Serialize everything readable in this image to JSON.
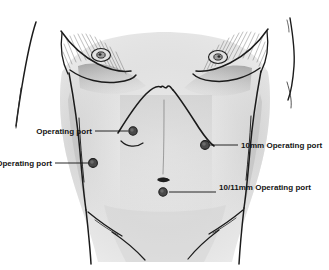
{
  "figure": {
    "background_color": "#ffffff",
    "ink_color": "#1b1b1b",
    "label_color": "#141414",
    "port_fill_color": "#4a4a4a",
    "port_rim_color": "#1c1c1c",
    "width": 329,
    "height": 270
  },
  "ports": [
    {
      "id": "port-upper-left",
      "label": "Operating port",
      "label_side": "left",
      "label_x": 92,
      "label_y": 134,
      "leader_from_x": 95,
      "leader_from_y": 131,
      "leader_to_x": 128,
      "leader_to_y": 131,
      "dot_x": 133,
      "dot_y": 131,
      "dot_r": 4.2
    },
    {
      "id": "port-lower-left",
      "label": "Operating port",
      "label_side": "left",
      "label_x": 52,
      "label_y": 166,
      "leader_from_x": 55,
      "leader_from_y": 163,
      "leader_to_x": 88,
      "leader_to_y": 163,
      "dot_x": 93,
      "dot_y": 163,
      "dot_r": 4.4
    },
    {
      "id": "port-10mm-right",
      "label": "10mm Operating port",
      "label_side": "right",
      "label_x": 241,
      "label_y": 148,
      "leader_from_x": 210,
      "leader_from_y": 145,
      "leader_to_x": 238,
      "leader_to_y": 145,
      "dot_x": 205,
      "dot_y": 145,
      "dot_r": 4.4
    },
    {
      "id": "port-10-11mm-umbilical",
      "label": "10/11mm Operating port",
      "label_side": "right",
      "label_x": 219,
      "label_y": 190,
      "leader_from_x": 169,
      "leader_from_y": 192,
      "leader_to_x": 216,
      "leader_to_y": 192,
      "dot_x": 163,
      "dot_y": 192,
      "dot_r": 4.2
    }
  ],
  "anatomy": {
    "navel_x": 163,
    "navel_y": 180,
    "left_nipple_x": 101,
    "left_nipple_y": 55,
    "right_nipple_x": 218,
    "right_nipple_y": 57
  }
}
